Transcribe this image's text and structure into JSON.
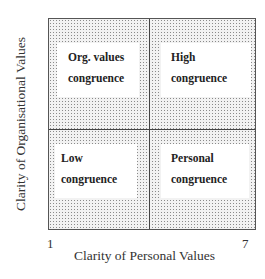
{
  "diagram": {
    "type": "2x2 matrix",
    "y_axis": {
      "label": "Clarity of Organisational Values"
    },
    "x_axis": {
      "label": "Clarity of Personal Values",
      "min_tick": "1",
      "max_tick": "7"
    },
    "quadrants": {
      "top_left": {
        "line1": "Org. values",
        "line2": "congruence"
      },
      "top_right": {
        "line1": "High",
        "line2": "congruence"
      },
      "bottom_left": {
        "line1": "Low",
        "line2": "congruence"
      },
      "bottom_right": {
        "line1": "Personal",
        "line2": "congruence"
      }
    },
    "colors": {
      "frame": "#555555",
      "dots": "#8a8a8a",
      "box": "#ffffff"
    }
  }
}
